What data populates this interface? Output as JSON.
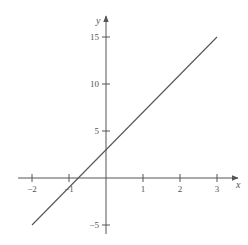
{
  "chart_data": {
    "type": "line",
    "title": "",
    "xlabel": "x",
    "ylabel": "y",
    "xlim": [
      -2.4,
      3.5
    ],
    "ylim": [
      -6.5,
      17
    ],
    "grid": false,
    "legend": null,
    "x_ticks": [
      -2,
      -1,
      1,
      2,
      3
    ],
    "x_tick_labels": [
      "−2",
      "−1",
      "1",
      "2",
      "3"
    ],
    "y_ticks": [
      -5,
      5,
      10,
      15
    ],
    "y_tick_labels": [
      "−5",
      "5",
      "10",
      "15"
    ],
    "series": [
      {
        "name": "y = 4x + 3",
        "x": [
          -2,
          3
        ],
        "values": [
          -5,
          15
        ]
      }
    ],
    "colors": {
      "axis": "#555555",
      "line": "#555555"
    }
  }
}
